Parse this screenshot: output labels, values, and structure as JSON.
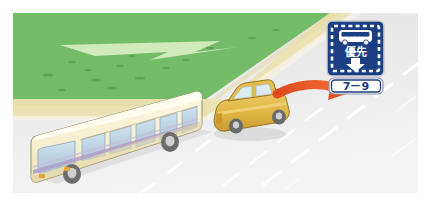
{
  "illustration": {
    "title": "Bus priority lane road scene",
    "description": "Illustration of a cream bus and a gold sedan travelling on a grey road beside a green grass verge, with a blue bus-priority road sign and a red arrow pointing from the car to the sign."
  },
  "road_sign": {
    "name": "bus-priority-sign",
    "board": {
      "icon": "bus-icon",
      "text": "優先",
      "arrow": "down-arrow-icon",
      "background_color": "#1c3f84",
      "foreground_color": "#ffffff"
    },
    "supplementary_plate": {
      "name": "time-restriction-plate",
      "text": "7－9",
      "background_color": "#ffffff",
      "border_color": "#1c3f84",
      "text_color": "#1c3f84"
    }
  },
  "vehicles": [
    {
      "name": "bus",
      "type": "bus-icon",
      "body_color": "#f5efd0",
      "window_color": "#bcd4e6",
      "stripe_color": "#b0a0c4"
    },
    {
      "name": "car",
      "type": "car-icon",
      "body_color": "#e0b94a",
      "window_color": "#d8e7ef"
    }
  ],
  "annotation_arrow": {
    "name": "red-pointer-arrow",
    "color": "#e8502a",
    "direction": "right",
    "points_from": "car",
    "points_to": "bus-priority-sign"
  },
  "environment": {
    "grass_color": "#76bf6a",
    "grass_path_color": "#d9edbf",
    "shoulder_color": "#ece3b4",
    "road_color": "#eaeaea",
    "lane_marking_color": "#ffffff",
    "lane_marking_style": "dashed"
  },
  "caption": {
    "left": "",
    "middle": "",
    "right": ""
  }
}
